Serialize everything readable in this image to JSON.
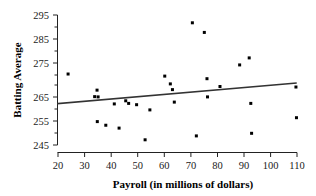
{
  "chart_data": {
    "type": "scatter",
    "title": "",
    "xlabel": "Payroll (in millions of dollars)",
    "ylabel": "Batting Average",
    "xlim": [
      20,
      110
    ],
    "ylim": [
      243,
      297
    ],
    "xticks": [
      20,
      30,
      40,
      50,
      60,
      70,
      80,
      90,
      100,
      110
    ],
    "yticks": [
      245,
      255,
      265,
      275,
      285,
      295
    ],
    "grid": false,
    "legend": null,
    "point_color": "#000000",
    "line_color": "#333333",
    "points": [
      {
        "x": 23.8,
        "y": 272.3
      },
      {
        "x": 34.7,
        "y": 266.1
      },
      {
        "x": 33.8,
        "y": 263.6
      },
      {
        "x": 35.1,
        "y": 263.5
      },
      {
        "x": 34.8,
        "y": 254.0
      },
      {
        "x": 38.0,
        "y": 252.6
      },
      {
        "x": 41.2,
        "y": 260.8
      },
      {
        "x": 43.0,
        "y": 251.5
      },
      {
        "x": 45.5,
        "y": 262.0
      },
      {
        "x": 46.6,
        "y": 261.0
      },
      {
        "x": 49.6,
        "y": 260.5
      },
      {
        "x": 52.8,
        "y": 247.0
      },
      {
        "x": 54.6,
        "y": 258.5
      },
      {
        "x": 60.2,
        "y": 271.5
      },
      {
        "x": 62.3,
        "y": 268.5
      },
      {
        "x": 63.1,
        "y": 266.3
      },
      {
        "x": 63.8,
        "y": 261.5
      },
      {
        "x": 70.6,
        "y": 292.0
      },
      {
        "x": 75.1,
        "y": 288.3
      },
      {
        "x": 72.1,
        "y": 248.5
      },
      {
        "x": 76.1,
        "y": 270.5
      },
      {
        "x": 76.3,
        "y": 263.5
      },
      {
        "x": 81.0,
        "y": 267.5
      },
      {
        "x": 88.4,
        "y": 275.8
      },
      {
        "x": 92.0,
        "y": 278.5
      },
      {
        "x": 92.6,
        "y": 261.0
      },
      {
        "x": 92.9,
        "y": 249.5
      },
      {
        "x": 109.6,
        "y": 267.3
      },
      {
        "x": 109.8,
        "y": 255.5
      }
    ],
    "trend_line": {
      "x_start": 20.0,
      "y_start": 260.9,
      "x_end": 109.6,
      "y_end": 268.8
    }
  }
}
